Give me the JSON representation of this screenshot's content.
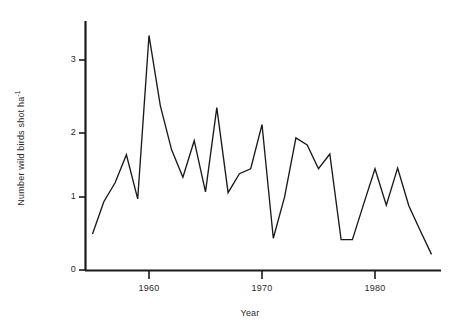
{
  "chart_data": {
    "type": "line",
    "title": "",
    "xlabel": "Year",
    "ylabel": "Number wild birds shot ha",
    "ylabel_exponent": "-1",
    "xlim": [
      1954.5,
      1985.5
    ],
    "ylim": [
      0,
      3.5
    ],
    "grid": false,
    "legend": null,
    "xticks": [
      1960,
      1970,
      1980
    ],
    "xtick_labels": [
      "1960",
      "1970",
      "1980"
    ],
    "yticks": [
      0,
      1,
      2,
      3
    ],
    "ytick_labels": [
      "0",
      "1",
      "2",
      "3"
    ],
    "line_color": "#1a1a1a",
    "axis_color": "#1a1a1a",
    "x": [
      1955,
      1956,
      1957,
      1958,
      1959,
      1960,
      1961,
      1962,
      1963,
      1964,
      1965,
      1966,
      1967,
      1968,
      1969,
      1970,
      1971,
      1972,
      1973,
      1974,
      1975,
      1976,
      1977,
      1978,
      1979,
      1980,
      1981,
      1982,
      1983,
      1984,
      1985
    ],
    "values": [
      0.52,
      0.98,
      1.25,
      1.65,
      1.02,
      3.35,
      2.35,
      1.72,
      1.33,
      1.85,
      1.12,
      2.32,
      1.11,
      1.38,
      1.45,
      2.08,
      0.46,
      1.05,
      1.89,
      1.79,
      1.45,
      1.66,
      0.44,
      0.44,
      0.95,
      1.45,
      0.93,
      1.46,
      0.92,
      0.57,
      0.23
    ],
    "series": [
      {
        "name": "Number wild birds shot per hectare",
        "values": [
          0.52,
          0.98,
          1.25,
          1.65,
          1.02,
          3.35,
          2.35,
          1.72,
          1.33,
          1.85,
          1.12,
          2.32,
          1.11,
          1.38,
          1.45,
          2.08,
          0.46,
          1.05,
          1.89,
          1.79,
          1.45,
          1.66,
          0.44,
          0.44,
          0.95,
          1.45,
          0.93,
          1.46,
          0.92,
          0.57,
          0.23
        ]
      }
    ]
  },
  "axes": {
    "y_title_text": "Number wild birds shot ha",
    "y_title_exp": "-1",
    "x_title_text": "Year",
    "ytick_0": "0",
    "ytick_1": "1",
    "ytick_2": "2",
    "ytick_3": "3",
    "xtick_1960": "1960",
    "xtick_1970": "1970",
    "xtick_1980": "1980"
  }
}
